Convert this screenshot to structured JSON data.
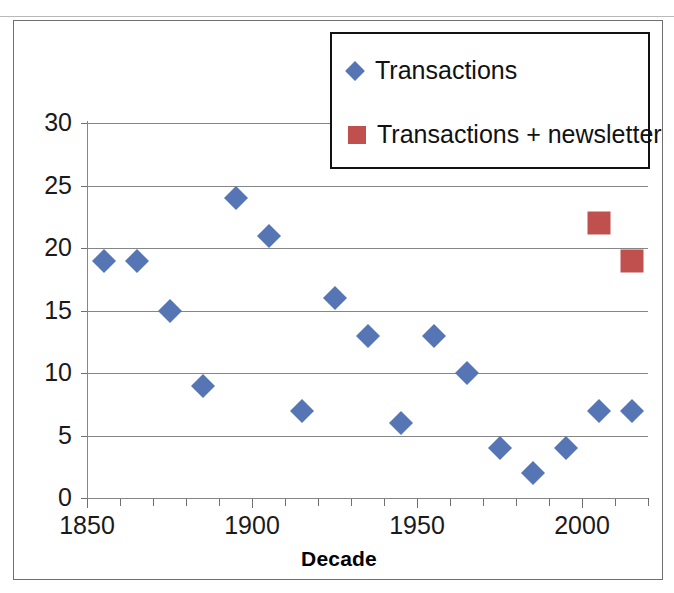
{
  "chart_data": {
    "type": "scatter",
    "title": "",
    "xlabel": "Decade",
    "ylabel": "",
    "xlim": [
      1850,
      2020
    ],
    "ylim": [
      0,
      30
    ],
    "grid": true,
    "legend_position": "top-right",
    "y_ticks": [
      30,
      25,
      20,
      15,
      10,
      5,
      0
    ],
    "x_ticks": [
      1850,
      1860,
      1870,
      1880,
      1890,
      1900,
      1910,
      1920,
      1930,
      1940,
      1950,
      1960,
      1970,
      1980,
      1990,
      2000,
      2010,
      2020
    ],
    "x_tick_labels": [
      "1850",
      "1900",
      "1950",
      "2000"
    ],
    "x_labeled_ticks": [
      1850,
      1900,
      1950,
      2000
    ],
    "series": [
      {
        "name": "Transactions",
        "marker": "diamond",
        "color": "#5675b4",
        "x": [
          1855,
          1865,
          1875,
          1885,
          1895,
          1905,
          1915,
          1925,
          1935,
          1945,
          1955,
          1965,
          1975,
          1985,
          1995,
          2005,
          2015
        ],
        "values": [
          19,
          19,
          15,
          9,
          24,
          21,
          7,
          16,
          13,
          6,
          13,
          10,
          4,
          2,
          4,
          7,
          7
        ]
      },
      {
        "name": "Transactions + newsletter",
        "marker": "square",
        "color": "#c0504d",
        "x": [
          2005,
          2015
        ],
        "values": [
          22,
          19
        ]
      }
    ]
  },
  "legend": {
    "items": [
      {
        "label": "Transactions",
        "marker": "diamond",
        "color": "#5675b4"
      },
      {
        "label": "Transactions + newsletter",
        "marker": "square",
        "color": "#c0504d"
      }
    ]
  },
  "axes": {
    "x_title": "Decade"
  }
}
